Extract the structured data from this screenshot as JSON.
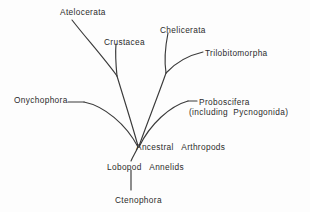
{
  "diagram": {
    "type": "phylogenetic-tree",
    "background_color": "#fdfdfd",
    "line_color": "#3a3a3a",
    "text_color": "#2b2b2b",
    "taxa": [
      {
        "id": "atelocerata",
        "label": "Atelocerata",
        "x": 60,
        "y": 8
      },
      {
        "id": "crustacea",
        "label": "Crustacea",
        "x": 104,
        "y": 38
      },
      {
        "id": "chelicerata",
        "label": "Chelicerata",
        "x": 160,
        "y": 26
      },
      {
        "id": "trilobitomorpha",
        "label": "Trilobitomorpha",
        "x": 205,
        "y": 49
      },
      {
        "id": "onychophora",
        "label": "Onychophora",
        "x": 14,
        "y": 96
      },
      {
        "id": "proboscifera",
        "label": "Proboscifera",
        "x": 199,
        "y": 98
      },
      {
        "id": "pycnogonida",
        "label": "(including  Pycnogonida)",
        "x": 189,
        "y": 108
      },
      {
        "id": "ancestral",
        "label": "Ancestral   Arthropods",
        "x": 136,
        "y": 143
      },
      {
        "id": "lobopod",
        "label": "Lobopod   Annelids",
        "x": 107,
        "y": 163
      },
      {
        "id": "ctenophora",
        "label": "Ctenophora",
        "x": 115,
        "y": 196
      }
    ],
    "branches": [
      {
        "id": "atelocerata-branch",
        "path": "M 72 20 C 86 38, 104 58, 117 76"
      },
      {
        "id": "crustacea-branch",
        "path": "M 116 44 C 115 56, 116 66, 117 76"
      },
      {
        "id": "crustacea-clade-stem",
        "path": "M 117 76 C 123 96, 132 124, 138 146"
      },
      {
        "id": "chelicerata-branch",
        "path": "M 168 33 C 165 48, 164 60, 166 73"
      },
      {
        "id": "trilobitomorpha-branch",
        "path": "M 203 52 C 190 55, 176 62, 166 73"
      },
      {
        "id": "chelicerata-clade-stem",
        "path": "M 166 73 C 158 96, 146 126, 139 146"
      },
      {
        "id": "onychophora-tick",
        "path": "M 68 102 L 84 102"
      },
      {
        "id": "onychophora-branch",
        "path": "M 84 102 C 104 106, 126 124, 138 147"
      },
      {
        "id": "proboscifera-tick",
        "path": "M 188 101 L 197 101"
      },
      {
        "id": "proboscifera-branch",
        "path": "M 188 101 C 170 106, 150 124, 139 147"
      },
      {
        "id": "ancestral-to-lobopod",
        "path": "M 138 147 C 136 152, 133 156, 131 161"
      },
      {
        "id": "lobopod-to-ctenophora",
        "path": "M 131 170 L 131 190"
      }
    ]
  }
}
